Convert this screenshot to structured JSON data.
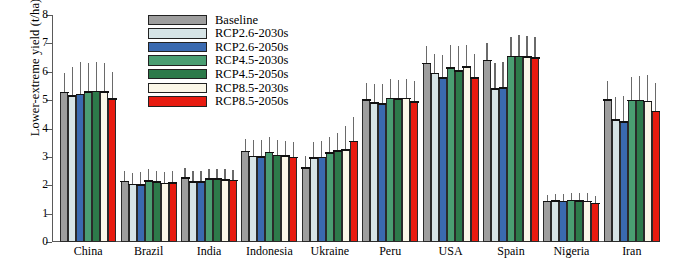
{
  "chart_data": {
    "type": "bar",
    "title": "",
    "xlabel": "",
    "ylabel": "Lower-extreme yield (t/ha)",
    "ylim": [
      0,
      8
    ],
    "yticks": [
      0,
      1,
      2,
      3,
      4,
      5,
      6,
      7,
      8
    ],
    "grid": false,
    "legend_position": "top-center",
    "categories": [
      "China",
      "Brazil",
      "India",
      "Indonesia",
      "Ukraine",
      "Peru",
      "USA",
      "Spain",
      "Nigeria",
      "Iran"
    ],
    "series": [
      {
        "name": "Baseline",
        "color": "#9e9e9e",
        "values": [
          5.27,
          2.14,
          2.26,
          3.2,
          2.62,
          5.01,
          6.3,
          6.41,
          1.44,
          5.01
        ],
        "err_low": [
          4.62,
          1.8,
          1.92,
          2.72,
          2.2,
          4.38,
          5.5,
          5.55,
          1.22,
          4.3
        ],
        "err_high": [
          5.95,
          2.52,
          2.62,
          3.62,
          3.02,
          5.62,
          6.92,
          7.0,
          1.66,
          5.66
        ]
      },
      {
        "name": "RCP2.6-2030s",
        "color": "#d6e4e6",
        "values": [
          5.16,
          2.03,
          2.13,
          3.02,
          2.97,
          4.9,
          5.94,
          5.4,
          1.45,
          4.31
        ],
        "err_low": [
          4.1,
          1.64,
          1.8,
          2.52,
          2.44,
          4.24,
          5.12,
          4.48,
          1.2,
          3.4
        ],
        "err_high": [
          6.18,
          2.44,
          2.5,
          3.58,
          3.52,
          5.56,
          6.62,
          6.3,
          1.68,
          5.12
        ]
      },
      {
        "name": "RCP2.6-2050s",
        "color": "#3a6ab0",
        "values": [
          5.2,
          2.02,
          2.12,
          3.01,
          2.99,
          4.88,
          5.79,
          5.44,
          1.44,
          4.24
        ],
        "err_low": [
          4.02,
          1.62,
          1.78,
          2.5,
          2.42,
          4.18,
          4.96,
          4.42,
          1.18,
          3.32
        ],
        "err_high": [
          6.34,
          2.46,
          2.52,
          3.58,
          3.56,
          5.58,
          6.6,
          6.36,
          1.7,
          5.16
        ]
      },
      {
        "name": "RCP4.5-2030s",
        "color": "#4a9e72",
        "values": [
          5.3,
          2.16,
          2.23,
          3.16,
          3.14,
          5.06,
          6.14,
          6.55,
          1.47,
          5.0
        ],
        "err_low": [
          4.22,
          1.76,
          1.88,
          2.64,
          2.56,
          4.36,
          5.3,
          5.5,
          1.22,
          4.04
        ],
        "err_high": [
          6.3,
          2.56,
          2.58,
          3.7,
          3.7,
          5.74,
          6.96,
          7.24,
          1.72,
          5.8
        ]
      },
      {
        "name": "RCP4.5-2050s",
        "color": "#2d7a4a",
        "values": [
          5.31,
          2.12,
          2.23,
          3.05,
          3.22,
          5.04,
          6.04,
          6.55,
          1.46,
          5.0
        ],
        "err_low": [
          4.16,
          1.72,
          1.86,
          2.56,
          2.6,
          4.32,
          5.18,
          5.46,
          1.2,
          3.98
        ],
        "err_high": [
          6.34,
          2.52,
          2.58,
          3.58,
          3.84,
          5.72,
          6.9,
          7.28,
          1.74,
          5.84
        ]
      },
      {
        "name": "RCP8.5-2030s",
        "color": "#fbf7e8",
        "values": [
          5.3,
          2.07,
          2.2,
          3.03,
          3.26,
          5.06,
          6.18,
          6.52,
          1.44,
          4.96
        ],
        "err_low": [
          3.92,
          1.68,
          1.84,
          2.52,
          2.44,
          4.34,
          5.22,
          5.44,
          1.18,
          3.76
        ],
        "err_high": [
          6.32,
          2.48,
          2.56,
          3.56,
          4.08,
          5.76,
          6.94,
          7.26,
          1.72,
          5.9
        ]
      },
      {
        "name": "RCP8.5-2050s",
        "color": "#e81b10",
        "values": [
          5.05,
          2.09,
          2.17,
          2.99,
          3.55,
          4.95,
          5.79,
          6.5,
          1.36,
          4.61
        ],
        "err_low": [
          3.86,
          1.7,
          1.82,
          2.48,
          2.7,
          4.26,
          4.92,
          5.4,
          1.14,
          3.5
        ],
        "err_high": [
          6.0,
          2.5,
          2.54,
          3.52,
          4.4,
          5.66,
          6.62,
          7.22,
          1.62,
          5.62
        ]
      }
    ]
  },
  "legend": {
    "items": [
      {
        "label": "Baseline"
      },
      {
        "label": "RCP2.6-2030s"
      },
      {
        "label": "RCP2.6-2050s"
      },
      {
        "label": "RCP4.5-2030s"
      },
      {
        "label": "RCP4.5-2050s"
      },
      {
        "label": "RCP8.5-2030s"
      },
      {
        "label": "RCP8.5-2050s"
      }
    ]
  }
}
